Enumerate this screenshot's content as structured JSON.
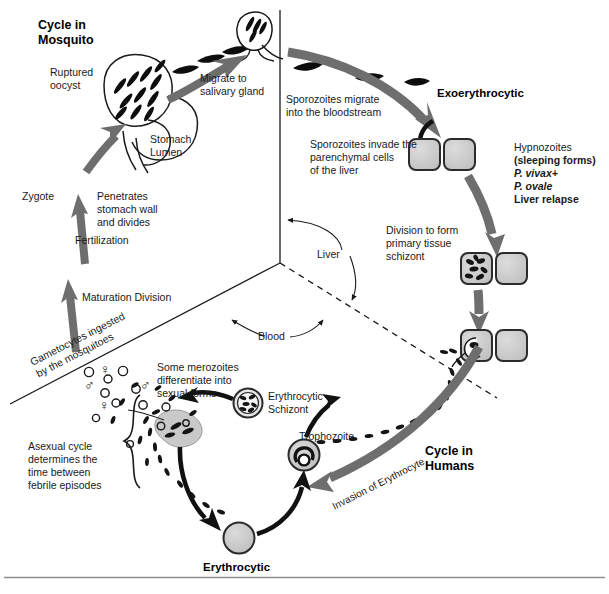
{
  "figure": {
    "type": "diagram",
    "titles": {
      "mosquito": "Cycle in\nMosquito",
      "humans": "Cycle in\nHumans"
    },
    "compartment_labels": {
      "liver": "Liver",
      "blood": "Blood"
    },
    "mosquito_cycle": {
      "ruptured_oocyst": "Ruptured\noocyst",
      "stomach_lumen": "Stomach\nLumen",
      "migrate_to_salivary_gland": "Migrate to\nsalivary gland",
      "zygote": "Zygote",
      "penetrates": "Penetrates\nstomach wall\nand divides",
      "fertilization": "Fertilization",
      "maturation_division": "Maturation Division",
      "gametocytes_ingested": "Gametocytes ingested\nby the mosquitoes"
    },
    "human_cycle": {
      "sporozoites_migrate": "Sporozoites migrate\ninto the bloodstream",
      "exoerythrocytic": "Exoerythrocytic",
      "sporozoites_invade": "Sporozoites invade the\nparenchymal cells\nof the liver",
      "hypnozoites_line1": "Hypnozoites",
      "hypnozoites_line2": "(sleeping forms)",
      "hypnozoites_line3": "P. vivax+",
      "hypnozoites_line4": "P. ovale",
      "hypnozoites_line5": "Liver relapse",
      "division_to_form": "Division to form\nprimary tissue\nschizont",
      "invasion_of_erythrocyte": "Invasion of Erythrocyte",
      "erythrocytic_schizont": "Erythrocytic\nSchizont",
      "trophozoite": "Trophozoite",
      "erythrocytic": "Erythrocytic",
      "some_merozoites": "Some merozoites\ndifferentiate into\nsexual forms",
      "asexual_cycle": "Asexual cycle\ndetermines the\ntime between\nfebrile episodes"
    },
    "colors": {
      "gray_arrow": "#6e6e6e",
      "black_arrow": "#111111",
      "cell_fill": "#c9c9c9",
      "cell_stroke": "#2b2b2b",
      "line": "#1a1a1a",
      "background": "#ffffff"
    },
    "glyphs": {
      "male_symbol": "♂",
      "female_symbol": "♀"
    }
  }
}
